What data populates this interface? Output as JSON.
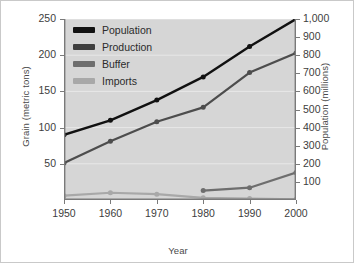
{
  "chart_data": {
    "type": "line",
    "title": "",
    "xlabel": "Year",
    "ylabel": "Grain (metric tons)",
    "y2label": "Population (millions)",
    "x": [
      1950,
      1960,
      1970,
      1980,
      1990,
      2000
    ],
    "xtick_labels": [
      "1950",
      "1960",
      "1970",
      "1980",
      "1990",
      "2000"
    ],
    "xlim": [
      1950,
      2000
    ],
    "ylim": [
      0,
      250
    ],
    "ytick_values": [
      50,
      100,
      150,
      200,
      250
    ],
    "ytick_labels": [
      "50",
      "100",
      "150",
      "200",
      "250"
    ],
    "y2lim": [
      0,
      1000
    ],
    "y2tick_values": [
      100,
      200,
      300,
      400,
      500,
      600,
      700,
      800,
      900,
      1000
    ],
    "y2tick_labels": [
      "100",
      "200",
      "300",
      "400",
      "500",
      "600",
      "700",
      "800",
      "900",
      "1,000"
    ],
    "grid": true,
    "legend_position": "upper left",
    "series": [
      {
        "name": "Population",
        "axis": "right",
        "color": "#111111",
        "values_right_axis": [
          360,
          440,
          550,
          680,
          850,
          1000
        ],
        "values": [
          90,
          110,
          138,
          170,
          212,
          250
        ]
      },
      {
        "name": "Production",
        "axis": "left",
        "color": "#4d4d4d",
        "values": [
          51,
          81,
          108,
          128,
          176,
          203
        ]
      },
      {
        "name": "Buffer",
        "axis": "left",
        "color": "#6e6e6e",
        "values": [
          null,
          null,
          null,
          13,
          17,
          38
        ]
      },
      {
        "name": "Imports",
        "axis": "left",
        "color": "#a8a8a8",
        "values": [
          6,
          10,
          8,
          3,
          2,
          1
        ]
      }
    ]
  },
  "legend": {
    "items": [
      {
        "label": "Population",
        "color": "#111111"
      },
      {
        "label": "Production",
        "color": "#3f3f3f"
      },
      {
        "label": "Buffer",
        "color": "#6e6e6e"
      },
      {
        "label": "Imports",
        "color": "#a8a8a8"
      }
    ]
  },
  "colors": {
    "plot_background": "#d6d6d6",
    "page_background": "#ffffff",
    "gridline": "#e8e8e8",
    "axis": "#7a7a7a",
    "tick_text": "#3d3d3d",
    "axis_title_text": "#4a4a4a"
  }
}
